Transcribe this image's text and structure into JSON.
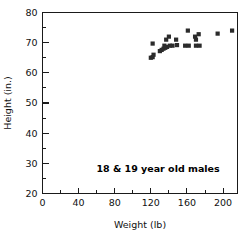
{
  "chart_data": {
    "type": "scatter",
    "title": "",
    "xlabel": "Weight (lb)",
    "ylabel": "Height (in.)",
    "xlim": [
      0,
      216
    ],
    "ylim": [
      20,
      80
    ],
    "xticks": [
      0,
      40,
      80,
      120,
      160,
      200
    ],
    "yticks": [
      20,
      30,
      40,
      50,
      60,
      70,
      80
    ],
    "xticklabels": [
      "0",
      "40",
      "80",
      "120",
      "160",
      "200"
    ],
    "yticklabels": [
      "20",
      "30",
      "40",
      "50",
      "60",
      "70",
      "80"
    ],
    "x_minor_ticks": [
      20,
      60,
      100,
      140,
      180
    ],
    "y_minor_ticks": [
      25,
      35,
      45,
      55,
      65,
      75
    ],
    "grid": false,
    "legend": false,
    "annotations": [
      {
        "text": "18 & 19 year old males",
        "x": 128,
        "y": 27,
        "bold": true
      }
    ],
    "marker": {
      "shape": "square",
      "color": "#2b2b2b",
      "size_px": 4.2
    },
    "series": [
      {
        "name": "18 & 19 year old males",
        "points": [
          {
            "x": 120,
            "y": 65.0
          },
          {
            "x": 122,
            "y": 65.2
          },
          {
            "x": 123,
            "y": 66.0
          },
          {
            "x": 122,
            "y": 69.7
          },
          {
            "x": 130,
            "y": 67.2
          },
          {
            "x": 132,
            "y": 67.6
          },
          {
            "x": 134,
            "y": 68.0
          },
          {
            "x": 135,
            "y": 69.0
          },
          {
            "x": 136,
            "y": 68.3
          },
          {
            "x": 137,
            "y": 71.0
          },
          {
            "x": 138,
            "y": 68.6
          },
          {
            "x": 140,
            "y": 72.0
          },
          {
            "x": 141,
            "y": 69.0
          },
          {
            "x": 144,
            "y": 69.0
          },
          {
            "x": 148,
            "y": 71.0
          },
          {
            "x": 149,
            "y": 69.2
          },
          {
            "x": 158,
            "y": 69.0
          },
          {
            "x": 161,
            "y": 74.0
          },
          {
            "x": 162,
            "y": 69.0
          },
          {
            "x": 169,
            "y": 72.0
          },
          {
            "x": 170,
            "y": 71.0
          },
          {
            "x": 170,
            "y": 69.0
          },
          {
            "x": 173,
            "y": 72.8
          },
          {
            "x": 174,
            "y": 69.0
          },
          {
            "x": 194,
            "y": 73.0
          },
          {
            "x": 210,
            "y": 74.0
          }
        ]
      }
    ]
  }
}
